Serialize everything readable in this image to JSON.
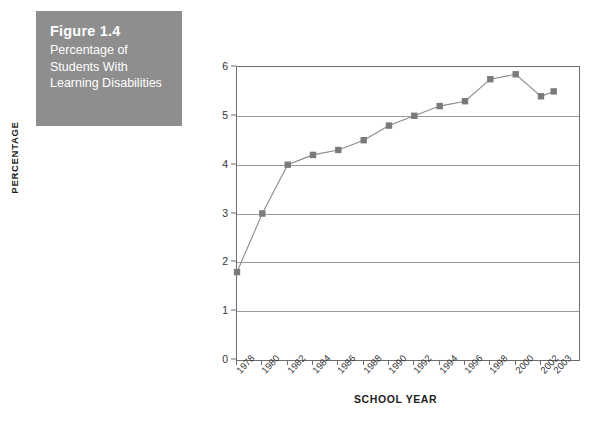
{
  "figure": {
    "number": "Figure 1.4",
    "caption": "Percentage of Students With Learning Disabilities",
    "box_color": "#8e8e8e",
    "text_color": "#ffffff"
  },
  "chart_data": {
    "type": "line",
    "title": "Percentage of Students With Learning Disabilities",
    "xlabel": "SCHOOL YEAR",
    "ylabel": "PERCENTAGE",
    "categories": [
      "1978",
      "1980",
      "1982",
      "1984",
      "1986",
      "1988",
      "1990",
      "1992",
      "1994",
      "1996",
      "1998",
      "2000",
      "2002",
      "2003"
    ],
    "values": [
      1.8,
      3.0,
      4.0,
      4.2,
      4.3,
      4.5,
      4.8,
      5.0,
      5.2,
      5.3,
      5.75,
      5.85,
      5.4,
      5.5
    ],
    "ylim": [
      0,
      6
    ],
    "yticks": [
      0,
      1,
      2,
      3,
      4,
      5,
      6
    ],
    "ytick_labels": [
      "0",
      "1",
      "2",
      "3",
      "4",
      "5",
      "6"
    ],
    "grid": true,
    "grid_axis": "y",
    "legend": "none",
    "series_color": "#8a8a8a",
    "marker_color": "#7a7a7a",
    "marker": "square",
    "axis_color": "#6d6d6d",
    "grid_color": "#9a9a9a",
    "background": "#ffffff"
  }
}
